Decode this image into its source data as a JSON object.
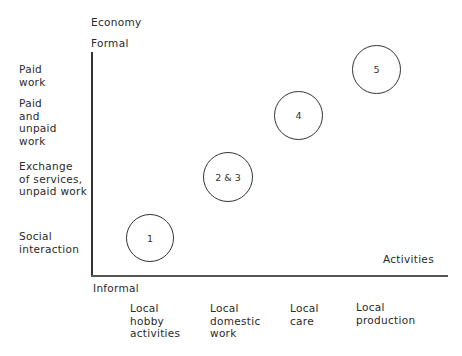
{
  "axes": {
    "y_title": "Economy",
    "y_top": "Formal",
    "y_bottom": "Informal",
    "x_title": "Activities"
  },
  "y_categories": [
    "Paid\nwork",
    "Paid\nand\nunpaid\nwork",
    "Exchange\nof services,\nunpaid work",
    "Social\ninteraction"
  ],
  "x_categories": [
    "Local\nhobby\nactivities",
    "Local\ndomestic\nwork",
    "Local\ncare",
    "Local\nproduction"
  ],
  "nodes": [
    {
      "label": "1"
    },
    {
      "label": "2 & 3"
    },
    {
      "label": "4"
    },
    {
      "label": "5"
    }
  ]
}
